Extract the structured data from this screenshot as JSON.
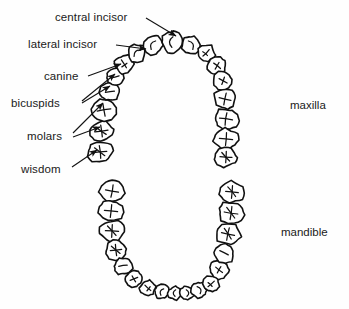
{
  "figure": {
    "type": "dental-arch-diagram",
    "background_color": "#fefefe",
    "ink_color": "#111111"
  },
  "labels": {
    "left": [
      {
        "id": "central-incisor",
        "text": "central incisor",
        "x": 55,
        "y": 11,
        "target_x": 176,
        "target_y": 38
      },
      {
        "id": "lateral-incisor",
        "text": "lateral incisor",
        "x": 28,
        "y": 38,
        "target_x": 146,
        "target_y": 50
      },
      {
        "id": "canine",
        "text": "canine",
        "x": 44,
        "y": 70,
        "target_x": 124,
        "target_y": 66
      },
      {
        "id": "bicuspids",
        "text": "bicuspids",
        "x": 11,
        "y": 97,
        "target_x": 114,
        "target_y": 80
      },
      {
        "id": "molars",
        "text": "molars",
        "x": 27,
        "y": 130,
        "target_x": 104,
        "target_y": 107
      },
      {
        "id": "wisdom",
        "text": "wisdom",
        "x": 21,
        "y": 163,
        "target_x": 100,
        "target_y": 152
      }
    ],
    "right": [
      {
        "id": "maxilla",
        "text": "maxilla",
        "x": 290,
        "y": 99
      },
      {
        "id": "mandible",
        "text": "mandible",
        "x": 281,
        "y": 226
      }
    ]
  },
  "arches": {
    "maxilla": {
      "name": "maxilla",
      "position": "upper",
      "tooth_count": 16,
      "opening": "down"
    },
    "mandible": {
      "name": "mandible",
      "position": "lower",
      "tooth_count": 16,
      "opening": "up"
    }
  },
  "tooth_types": [
    "central incisor",
    "lateral incisor",
    "canine",
    "bicuspids",
    "molars",
    "wisdom"
  ],
  "chart_data": {
    "type": "diagram",
    "title": "",
    "maxilla_teeth": [
      {
        "i": 0,
        "cx": 100.0,
        "cy": 152.0,
        "rx": 12.5,
        "ry": 10.5,
        "rot": -6,
        "kind": "molar"
      },
      {
        "i": 1,
        "cx": 101.5,
        "cy": 131.0,
        "rx": 12.0,
        "ry": 10.0,
        "rot": -8,
        "kind": "molar"
      },
      {
        "i": 2,
        "cx": 104.0,
        "cy": 110.0,
        "rx": 12.5,
        "ry": 10.5,
        "rot": -10,
        "kind": "molar"
      },
      {
        "i": 3,
        "cx": 110.0,
        "cy": 92.0,
        "rx": 10.0,
        "ry": 9.0,
        "rot": -16,
        "kind": "bicuspid"
      },
      {
        "i": 4,
        "cx": 115.0,
        "cy": 77.0,
        "rx": 9.5,
        "ry": 8.5,
        "rot": -22,
        "kind": "bicuspid"
      },
      {
        "i": 5,
        "cx": 124.0,
        "cy": 64.0,
        "rx": 9.5,
        "ry": 9.0,
        "rot": -32,
        "kind": "canine"
      },
      {
        "i": 6,
        "cx": 137.0,
        "cy": 53.0,
        "rx": 9.0,
        "ry": 8.5,
        "rot": -44,
        "kind": "lateral-incisor"
      },
      {
        "i": 7,
        "cx": 153.0,
        "cy": 45.0,
        "rx": 9.5,
        "ry": 9.0,
        "rot": -62,
        "kind": "central-incisor"
      },
      {
        "i": 8,
        "cx": 172.0,
        "cy": 42.0,
        "rx": 10.5,
        "ry": 10.0,
        "rot": -84,
        "kind": "central-incisor"
      },
      {
        "i": 9,
        "cx": 191.0,
        "cy": 45.0,
        "rx": 9.5,
        "ry": 9.0,
        "rot": 62,
        "kind": "lateral-incisor"
      },
      {
        "i": 10,
        "cx": 206.0,
        "cy": 53.0,
        "rx": 9.0,
        "ry": 8.5,
        "rot": 44,
        "kind": "canine"
      },
      {
        "i": 11,
        "cx": 217.0,
        "cy": 66.0,
        "rx": 9.5,
        "ry": 9.0,
        "rot": 30,
        "kind": "bicuspid"
      },
      {
        "i": 12,
        "cx": 223.0,
        "cy": 81.0,
        "rx": 10.0,
        "ry": 9.0,
        "rot": 20,
        "kind": "bicuspid"
      },
      {
        "i": 13,
        "cx": 225.0,
        "cy": 99.0,
        "rx": 11.0,
        "ry": 10.0,
        "rot": 12,
        "kind": "molar"
      },
      {
        "i": 14,
        "cx": 226.0,
        "cy": 119.0,
        "rx": 12.0,
        "ry": 10.5,
        "rot": 8,
        "kind": "molar"
      },
      {
        "i": 15,
        "cx": 226.0,
        "cy": 139.0,
        "rx": 12.0,
        "ry": 10.5,
        "rot": 5,
        "kind": "molar"
      },
      {
        "i": 16,
        "cx": 226.0,
        "cy": 157.0,
        "rx": 11.0,
        "ry": 9.5,
        "rot": 3,
        "kind": "wisdom"
      }
    ],
    "mandible_teeth": [
      {
        "i": 0,
        "cx": 112.0,
        "cy": 191.0,
        "rx": 12.0,
        "ry": 10.5,
        "rot": 10,
        "kind": "wisdom"
      },
      {
        "i": 1,
        "cx": 111.0,
        "cy": 211.0,
        "rx": 12.0,
        "ry": 10.5,
        "rot": 6,
        "kind": "molar"
      },
      {
        "i": 2,
        "cx": 112.0,
        "cy": 231.0,
        "rx": 12.0,
        "ry": 10.5,
        "rot": 3,
        "kind": "molar"
      },
      {
        "i": 3,
        "cx": 116.0,
        "cy": 250.0,
        "rx": 10.5,
        "ry": 9.5,
        "rot": -6,
        "kind": "molar"
      },
      {
        "i": 4,
        "cx": 123.0,
        "cy": 266.0,
        "rx": 9.5,
        "ry": 8.5,
        "rot": -16,
        "kind": "bicuspid"
      },
      {
        "i": 5,
        "cx": 134.0,
        "cy": 279.0,
        "rx": 9.0,
        "ry": 8.0,
        "rot": -30,
        "kind": "bicuspid"
      },
      {
        "i": 6,
        "cx": 148.0,
        "cy": 288.0,
        "rx": 8.0,
        "ry": 7.5,
        "rot": -48,
        "kind": "canine"
      },
      {
        "i": 7,
        "cx": 162.0,
        "cy": 292.0,
        "rx": 7.0,
        "ry": 7.0,
        "rot": -66,
        "kind": "lateral-incisor"
      },
      {
        "i": 8,
        "cx": 175.0,
        "cy": 293.0,
        "rx": 6.5,
        "ry": 7.0,
        "rot": -84,
        "kind": "central-incisor"
      },
      {
        "i": 9,
        "cx": 187.0,
        "cy": 293.0,
        "rx": 6.5,
        "ry": 7.0,
        "rot": 84,
        "kind": "central-incisor"
      },
      {
        "i": 10,
        "cx": 199.0,
        "cy": 290.0,
        "rx": 7.5,
        "ry": 7.5,
        "rot": 66,
        "kind": "lateral-incisor"
      },
      {
        "i": 11,
        "cx": 211.0,
        "cy": 284.0,
        "rx": 8.5,
        "ry": 8.0,
        "rot": 48,
        "kind": "canine"
      },
      {
        "i": 12,
        "cx": 219.0,
        "cy": 270.0,
        "rx": 9.5,
        "ry": 8.5,
        "rot": 30,
        "kind": "bicuspid"
      },
      {
        "i": 13,
        "cx": 224.0,
        "cy": 253.0,
        "rx": 10.5,
        "ry": 9.5,
        "rot": 18,
        "kind": "bicuspid"
      },
      {
        "i": 14,
        "cx": 228.0,
        "cy": 234.0,
        "rx": 12.0,
        "ry": 10.5,
        "rot": 12,
        "kind": "molar"
      },
      {
        "i": 15,
        "cx": 231.0,
        "cy": 213.0,
        "rx": 12.5,
        "ry": 11.0,
        "rot": 8,
        "kind": "molar"
      },
      {
        "i": 16,
        "cx": 232.0,
        "cy": 192.0,
        "rx": 11.5,
        "ry": 10.5,
        "rot": 5,
        "kind": "molar"
      }
    ]
  }
}
